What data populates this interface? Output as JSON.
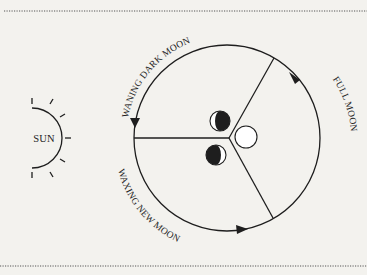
{
  "diagram": {
    "title": "",
    "labels": {
      "sun": "SUN",
      "waning": "WANING DARK MOON",
      "full": "FULL MOON",
      "waxing": "WAXING NEW MOON"
    },
    "nodes": [
      {
        "id": "sun",
        "label": "SUN",
        "shape": "half-circle-with-rays"
      },
      {
        "id": "orbit",
        "label": "",
        "shape": "circle",
        "sectors": 3
      },
      {
        "id": "waning-moon",
        "label": "WANING DARK MOON",
        "phase": "dark right, lit crescent left"
      },
      {
        "id": "full-moon",
        "label": "FULL MOON",
        "phase": "full (white)"
      },
      {
        "id": "waxing-moon",
        "label": "WAXING NEW MOON",
        "phase": "dark left, lit crescent right"
      }
    ],
    "edges": [
      {
        "from": "full-moon",
        "to": "waning-moon",
        "direction": "counter-clockwise arrow, top"
      },
      {
        "from": "waning-moon",
        "to": "waxing-moon",
        "direction": "counter-clockwise arrow, left"
      },
      {
        "from": "waxing-moon",
        "to": "full-moon",
        "direction": "counter-clockwise arrow, bottom"
      }
    ],
    "colors": {
      "background": "#f3f2ee",
      "ink": "#1e1e1e",
      "moon_dark": "#1e1e1e",
      "moon_light": "#ffffff"
    }
  }
}
